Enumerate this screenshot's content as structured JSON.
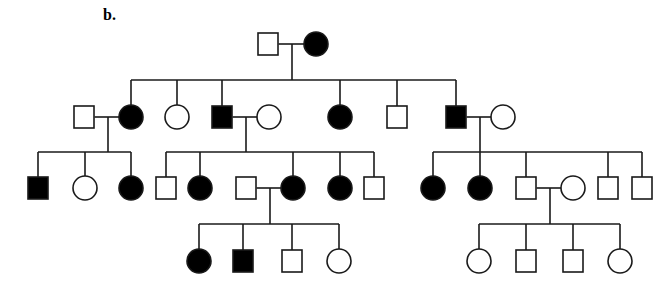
{
  "panel_label": "b.",
  "colors": {
    "line": "#1a1a1a",
    "affected": "#000000",
    "unaffected": "#ffffff"
  },
  "legend_semantics": {
    "square": "male",
    "circle": "female",
    "filled": "affected",
    "open": "unaffected"
  },
  "individuals": [
    {
      "id": "I-1",
      "gen": 1,
      "sex": "male",
      "affected": false,
      "cx": 268,
      "cy": 44
    },
    {
      "id": "I-2",
      "gen": 1,
      "sex": "female",
      "affected": true,
      "cx": 316,
      "cy": 44
    },
    {
      "id": "II-1",
      "gen": 2,
      "sex": "male",
      "affected": false,
      "cx": 84,
      "cy": 117,
      "spouse_in": true
    },
    {
      "id": "II-2",
      "gen": 2,
      "sex": "female",
      "affected": true,
      "cx": 131,
      "cy": 117
    },
    {
      "id": "II-3",
      "gen": 2,
      "sex": "female",
      "affected": false,
      "cx": 177,
      "cy": 117
    },
    {
      "id": "II-4",
      "gen": 2,
      "sex": "male",
      "affected": true,
      "cx": 222,
      "cy": 117
    },
    {
      "id": "II-5",
      "gen": 2,
      "sex": "female",
      "affected": false,
      "cx": 269,
      "cy": 117,
      "spouse_in": true
    },
    {
      "id": "II-6",
      "gen": 2,
      "sex": "female",
      "affected": true,
      "cx": 340,
      "cy": 117
    },
    {
      "id": "II-7",
      "gen": 2,
      "sex": "male",
      "affected": false,
      "cx": 397,
      "cy": 117
    },
    {
      "id": "II-8",
      "gen": 2,
      "sex": "male",
      "affected": true,
      "cx": 456,
      "cy": 117
    },
    {
      "id": "II-9",
      "gen": 2,
      "sex": "female",
      "affected": false,
      "cx": 503,
      "cy": 117,
      "spouse_in": true
    },
    {
      "id": "III-1",
      "gen": 3,
      "sex": "male",
      "affected": true,
      "cx": 38,
      "cy": 188
    },
    {
      "id": "III-2",
      "gen": 3,
      "sex": "female",
      "affected": false,
      "cx": 85,
      "cy": 188
    },
    {
      "id": "III-3",
      "gen": 3,
      "sex": "female",
      "affected": true,
      "cx": 131,
      "cy": 188
    },
    {
      "id": "III-4",
      "gen": 3,
      "sex": "male",
      "affected": false,
      "cx": 166,
      "cy": 188
    },
    {
      "id": "III-5",
      "gen": 3,
      "sex": "female",
      "affected": true,
      "cx": 200,
      "cy": 188
    },
    {
      "id": "III-6",
      "gen": 3,
      "sex": "male",
      "affected": false,
      "cx": 246,
      "cy": 188,
      "spouse_in": true
    },
    {
      "id": "III-7",
      "gen": 3,
      "sex": "female",
      "affected": true,
      "cx": 293,
      "cy": 188
    },
    {
      "id": "III-8",
      "gen": 3,
      "sex": "female",
      "affected": true,
      "cx": 340,
      "cy": 188
    },
    {
      "id": "III-9",
      "gen": 3,
      "sex": "male",
      "affected": false,
      "cx": 374,
      "cy": 188
    },
    {
      "id": "III-10",
      "gen": 3,
      "sex": "female",
      "affected": true,
      "cx": 433,
      "cy": 188
    },
    {
      "id": "III-11",
      "gen": 3,
      "sex": "female",
      "affected": true,
      "cx": 480,
      "cy": 188
    },
    {
      "id": "III-12",
      "gen": 3,
      "sex": "male",
      "affected": false,
      "cx": 526,
      "cy": 188
    },
    {
      "id": "III-13",
      "gen": 3,
      "sex": "female",
      "affected": false,
      "cx": 573,
      "cy": 188,
      "spouse_in": true
    },
    {
      "id": "III-14",
      "gen": 3,
      "sex": "male",
      "affected": false,
      "cx": 608,
      "cy": 188
    },
    {
      "id": "III-15",
      "gen": 3,
      "sex": "male",
      "affected": false,
      "cx": 642,
      "cy": 188
    },
    {
      "id": "IV-1",
      "gen": 4,
      "sex": "female",
      "affected": true,
      "cx": 199,
      "cy": 261
    },
    {
      "id": "IV-2",
      "gen": 4,
      "sex": "male",
      "affected": true,
      "cx": 243,
      "cy": 261
    },
    {
      "id": "IV-3",
      "gen": 4,
      "sex": "male",
      "affected": false,
      "cx": 292,
      "cy": 261
    },
    {
      "id": "IV-4",
      "gen": 4,
      "sex": "female",
      "affected": false,
      "cx": 339,
      "cy": 261
    },
    {
      "id": "IV-5",
      "gen": 4,
      "sex": "female",
      "affected": false,
      "cx": 479,
      "cy": 261
    },
    {
      "id": "IV-6",
      "gen": 4,
      "sex": "male",
      "affected": false,
      "cx": 526,
      "cy": 261
    },
    {
      "id": "IV-7",
      "gen": 4,
      "sex": "male",
      "affected": false,
      "cx": 573,
      "cy": 261
    },
    {
      "id": "IV-8",
      "gen": 4,
      "sex": "female",
      "affected": false,
      "cx": 620,
      "cy": 261
    }
  ],
  "matings": [
    {
      "partners": [
        "I-1",
        "I-2"
      ],
      "y": 44,
      "drop_x": 292,
      "bar_y": 80,
      "children": [
        "II-2",
        "II-3",
        "II-4",
        "II-6",
        "II-7",
        "II-8"
      ]
    },
    {
      "partners": [
        "II-1",
        "II-2"
      ],
      "y": 117,
      "drop_x": 108,
      "bar_y": 152,
      "children": [
        "III-1",
        "III-2",
        "III-3"
      ]
    },
    {
      "partners": [
        "II-4",
        "II-5"
      ],
      "y": 117,
      "drop_x": 246,
      "bar_y": 152,
      "children": [
        "III-4",
        "III-5",
        "III-7",
        "III-8",
        "III-9"
      ]
    },
    {
      "partners": [
        "II-8",
        "II-9"
      ],
      "y": 117,
      "drop_x": 480,
      "bar_y": 152,
      "children": [
        "III-10",
        "III-11",
        "III-12",
        "III-14",
        "III-15"
      ]
    },
    {
      "partners": [
        "III-6",
        "III-7"
      ],
      "y": 188,
      "drop_x": 270,
      "bar_y": 224,
      "children": [
        "IV-1",
        "IV-2",
        "IV-3",
        "IV-4"
      ]
    },
    {
      "partners": [
        "III-12",
        "III-13"
      ],
      "y": 188,
      "drop_x": 550,
      "bar_y": 224,
      "children": [
        "IV-5",
        "IV-6",
        "IV-7",
        "IV-8"
      ]
    }
  ],
  "symbol_size": {
    "square": 20,
    "circle_r": 12
  }
}
